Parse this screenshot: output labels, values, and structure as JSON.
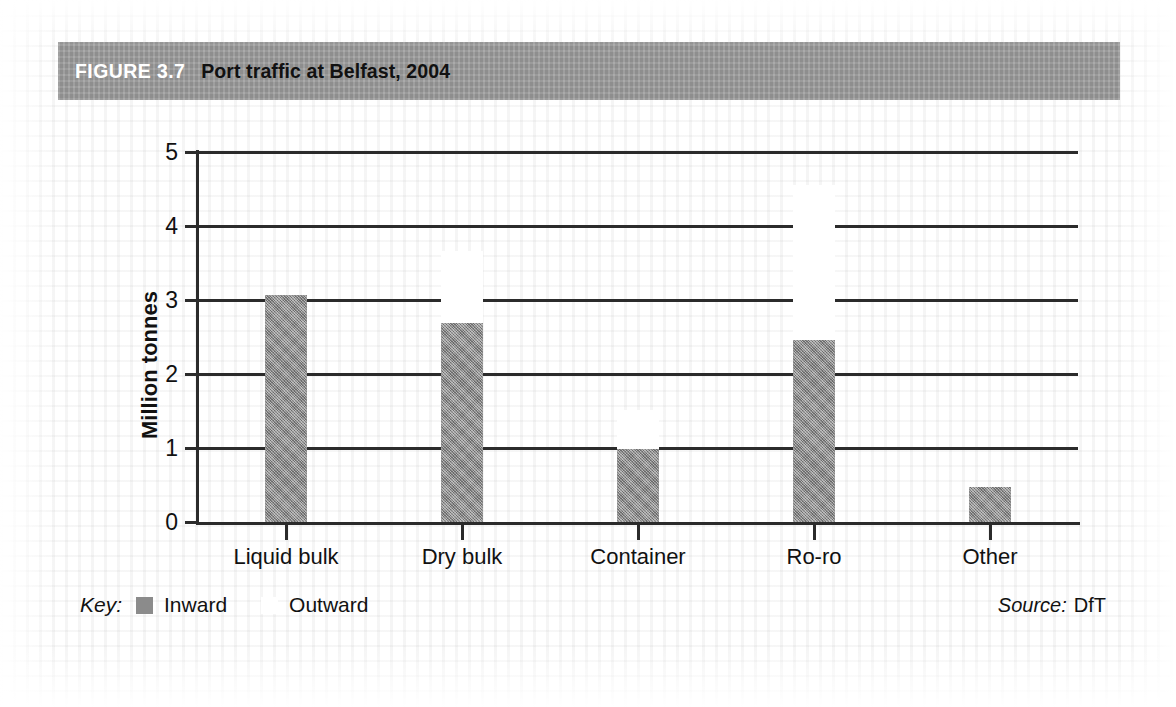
{
  "figure": {
    "number": "FIGURE 3.7",
    "caption": "Port traffic at Belfast, 2004"
  },
  "key": {
    "label": "Key:",
    "entries": [
      {
        "name": "Inward",
        "color": "#8b8b8b"
      },
      {
        "name": "Outward",
        "color": "#ffffff"
      }
    ]
  },
  "source": {
    "label": "Source:",
    "value": "DfT"
  },
  "colors": {
    "header_band": "#9a9a9a",
    "inward": "#8b8b8b",
    "outward": "#ffffff",
    "axis": "#2b2b2b",
    "text": "#111111"
  },
  "chart_data": {
    "type": "bar",
    "title": "Port traffic at Belfast, 2004",
    "subtitle": "",
    "xlabel": "",
    "ylabel": "Million tonnes",
    "ylim": [
      0,
      5
    ],
    "yticks": [
      0,
      1,
      2,
      3,
      4,
      5
    ],
    "ytick_labels": [
      "0",
      "1",
      "2",
      "3",
      "4",
      "5"
    ],
    "grid": "horizontal",
    "stacked": true,
    "legend_position": "bottom-left",
    "categories": [
      "Liquid bulk",
      "Dry bulk",
      "Container",
      "Ro-ro",
      "Other"
    ],
    "series": [
      {
        "name": "Inward",
        "color": "#8b8b8b",
        "values": [
          3.07,
          2.69,
          0.99,
          2.46,
          0.47
        ]
      },
      {
        "name": "Outward",
        "color": "#ffffff",
        "values": [
          0.0,
          0.97,
          0.52,
          2.09,
          0.0
        ]
      }
    ],
    "totals": [
      3.07,
      3.66,
      1.51,
      4.55,
      0.47
    ],
    "units": "Million tonnes"
  }
}
